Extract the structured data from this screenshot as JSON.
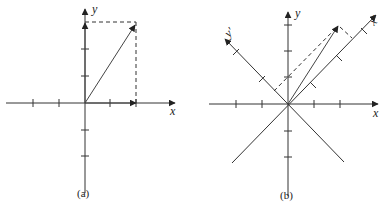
{
  "figure": {
    "panels": [
      {
        "id": "a",
        "caption": "(a)",
        "axes": {
          "x_label": "x",
          "y_label": "y"
        },
        "vector": {
          "x": 2,
          "y": 3
        },
        "ticks": {
          "x": [
            -2,
            -1,
            1,
            2
          ],
          "y": [
            -2,
            -1,
            1,
            2,
            3
          ]
        },
        "projections": "dashed lines to x and y components"
      },
      {
        "id": "b",
        "caption": "(b)",
        "axes": {
          "x_label": "x",
          "y_label": "y",
          "x_prime_label": "x'",
          "y_prime_label": "y'"
        },
        "rotation_deg": 45,
        "vector": {
          "x": 2,
          "y": 3
        },
        "ticks": {
          "x": [
            -2,
            -1,
            1,
            2
          ],
          "y": [
            -2,
            -1,
            1,
            2,
            3
          ],
          "x_prime": [
            1,
            2,
            3
          ],
          "y_prime": [
            1,
            2
          ]
        },
        "projections": "dashed lines to x' and y' components"
      }
    ]
  }
}
